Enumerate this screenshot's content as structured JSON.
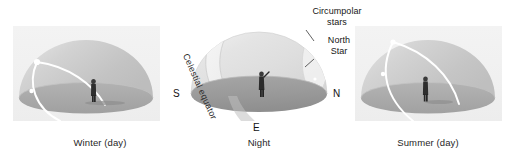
{
  "figure": {
    "background_color": "#ffffff",
    "panel_background_color": "#f1f1f1",
    "sky_color": "#c9c9c9",
    "ground_color": "#a8a8a8",
    "path_color": "#ffffff",
    "text_color": "#161616"
  },
  "panels": [
    {
      "id": "winter",
      "caption": "Winter (day)",
      "dome_kind": "celestial-dome",
      "path_name": "sun-path",
      "path_description": "low arc of the Sun across the sky in winter",
      "observer_label": "observer",
      "markers": [
        "sunrise-point",
        "sun-midpoint",
        "sun-position"
      ]
    },
    {
      "id": "night",
      "caption": "Night",
      "dome_kind": "celestial-dome",
      "path_name": "celestial-equator",
      "path_description": "celestial equator band and circumpolar star circle",
      "observer_label": "observer",
      "labels": {
        "celestial_equator": "Celestial equator",
        "circumpolar_stars_line1": "Circumpolar",
        "circumpolar_stars_line2": "stars",
        "north_star_line1": "North",
        "north_star_line2": "Star"
      },
      "compass": {
        "south": "S",
        "north": "N",
        "east": "E"
      }
    },
    {
      "id": "summer",
      "caption": "Summer (day)",
      "dome_kind": "celestial-dome",
      "path_name": "sun-path",
      "path_description": "high arc of the Sun across the sky in summer",
      "observer_label": "observer",
      "markers": [
        "sunrise-point",
        "sun-midpoint"
      ]
    }
  ]
}
